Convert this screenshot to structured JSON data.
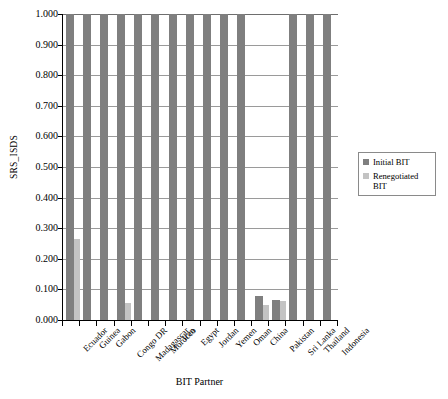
{
  "chart_data": {
    "type": "bar",
    "title": "",
    "xlabel": "BIT Partner",
    "ylabel": "SRS_ISDS",
    "ylim": [
      0.0,
      1.0
    ],
    "ytick_labels": [
      "1.000",
      "0.900",
      "0.800",
      "0.700",
      "0.600",
      "0.500",
      "0.400",
      "0.300",
      "0.200",
      "0.100",
      "0.000"
    ],
    "ytick_values": [
      1.0,
      0.9,
      0.8,
      0.7,
      0.6,
      0.5,
      0.4,
      0.3,
      0.2,
      0.1,
      0.0
    ],
    "grid": true,
    "legend_position": "right",
    "categories": [
      "Ecuador",
      "Guinea",
      "Gabon",
      "Congo DR",
      "Madagascar",
      "Morocco",
      "Iran",
      "Egypt",
      "Jordan",
      "Yemen",
      "Oman",
      "China",
      "Pakistan",
      "Sri Lanka",
      "Thailand",
      "Indonesia"
    ],
    "series": [
      {
        "name": "Initial BIT",
        "color": "#7f7f7f",
        "values": [
          1.0,
          1.0,
          1.0,
          1.0,
          1.0,
          1.0,
          1.0,
          1.0,
          1.0,
          1.0,
          1.0,
          0.078,
          0.065,
          1.0,
          1.0,
          1.0
        ]
      },
      {
        "name": "Renegotiated BIT",
        "color": "#c3c3c3",
        "values": [
          0.265,
          0.0,
          0.0,
          0.055,
          0.0,
          0.0,
          0.0,
          0.0,
          0.0,
          0.0,
          0.0,
          0.048,
          0.063,
          0.0,
          0.0,
          0.0
        ]
      }
    ]
  },
  "legend": {
    "items": [
      {
        "label": "Initial BIT"
      },
      {
        "label": "Renegotiated BIT"
      }
    ]
  }
}
